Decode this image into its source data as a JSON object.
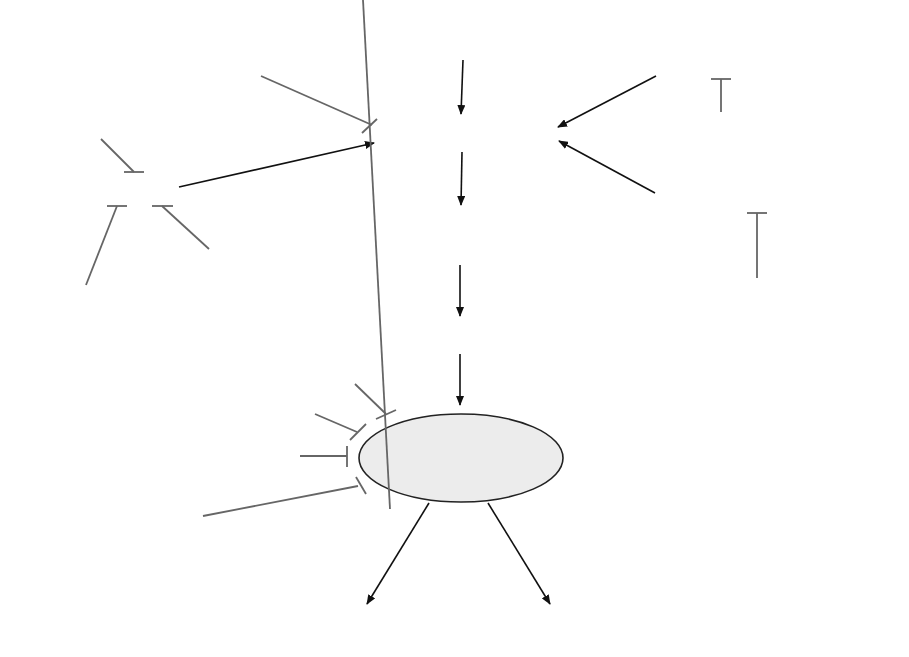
{
  "diagram": {
    "type": "pain-pathway-pharmacology",
    "colors": {
      "pathway_text": "#111111",
      "drug_text": "#5a5a5a",
      "arrow": "#111111",
      "inhibitor_line": "#666666",
      "brain_fill": "#ececec"
    },
    "pathway": {
      "tissue_damage": "Tissue damage",
      "pain_receptors": "Pain receptors",
      "nerve_cells_line1": "Pain-conducting",
      "nerve_cells_line2": "nerve cells",
      "spinal_cord": "Spinal cord",
      "brain": "Brain",
      "pain_perception": "Pain perception",
      "pain_assessment": "Pain assessment"
    },
    "peripheral_causes": {
      "colics": "Colics",
      "vasodilation_line1": "Vasodilation",
      "vasodilation_line2": "in migraine",
      "bone_metastases": "Bone metastases"
    },
    "peripheral_drugs": {
      "nsaids": "NSAIDs (Ibuprofen)",
      "glyceryl_line1": "Glyceryl",
      "glyceryl_line2": "trinitrate",
      "metamizole": "Metamizole",
      "parasympatholytics_line1": "Para-",
      "parasympatholytics_line2": "sympatholytics",
      "triptans": "Triptans",
      "bisphosphonates": "Bisphosphonates"
    },
    "central_drugs_left": {
      "cannabinoids": "Cannabinoids",
      "calcium": "Calcium channel blockers",
      "sodium": "Sodium channel blockers",
      "paracetamol_line1": "Paracetamol",
      "paracetamol_line2": "(acetaminophen)",
      "antidepressants": "Antidepressants"
    },
    "central_drugs_right": {
      "gaba": "GABA amplifiers",
      "opioid": "Opioid analgesics",
      "glutamate": "Glutamate inhibitors",
      "metamizole_dipyrone": "Metamizole (dipyrone)",
      "antipsychotics": "Antipsychotics"
    }
  }
}
